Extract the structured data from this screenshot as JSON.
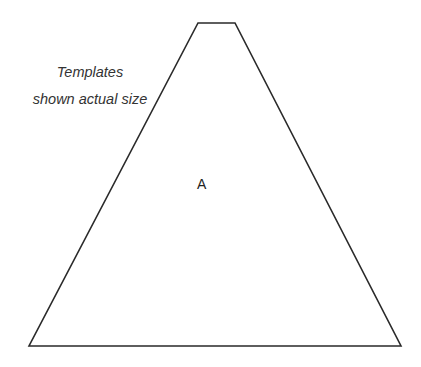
{
  "caption": {
    "line1": "Templates",
    "line2": "shown actual size"
  },
  "shape": {
    "type": "truncated-triangle",
    "label": "A",
    "stroke_color": "#2a2a2a",
    "fill_color": "#ffffff"
  }
}
